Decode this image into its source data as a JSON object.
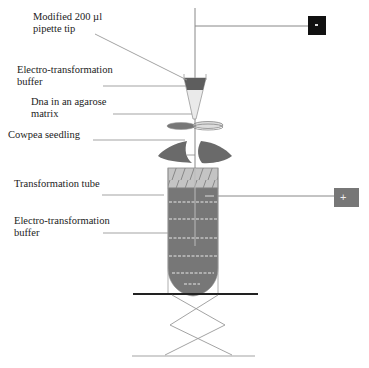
{
  "diagram": {
    "type": "apparatus-schematic",
    "labels": {
      "pipette_tip": "Modified 200 µl\npipette tip",
      "buffer_top": "Electro-transformation\nbuffer",
      "dna_agarose": "Dna in an agarose\nmatrix",
      "seedling": "Cowpea seedling",
      "tube": "Transformation tube",
      "buffer_bottom": "Electro-transformation\nbuffer"
    },
    "electrodes": [
      {
        "name": "negative-electrode",
        "symbol": "-",
        "color": "#111111"
      },
      {
        "name": "positive-electrode",
        "symbol": "+",
        "color": "#777777"
      }
    ],
    "colors": {
      "line": "#888888",
      "dark_fill": "#666666",
      "tube_fill": "#7a7a7a",
      "hatch_fill": "#bdbdbd",
      "platform": "#222222"
    }
  }
}
